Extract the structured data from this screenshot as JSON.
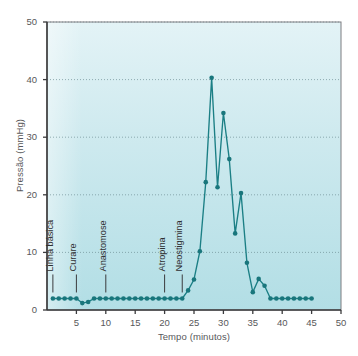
{
  "chart_data": {
    "type": "line",
    "title": "",
    "xlabel": "Tempo (minutos)",
    "ylabel": "Pressão (mmHg)",
    "xlim": [
      0,
      50
    ],
    "ylim": [
      0,
      50
    ],
    "xticks": [
      5,
      10,
      15,
      20,
      25,
      30,
      35,
      40,
      45,
      50
    ],
    "yticks": [
      0,
      10,
      20,
      30,
      40,
      50
    ],
    "grid": "horizontal-dotted",
    "legend": "none",
    "series": [
      {
        "name": "Pressão",
        "color": "#1b7f85",
        "marker": "circle",
        "x": [
          1,
          2,
          3,
          4,
          5,
          6,
          7,
          8,
          9,
          10,
          11,
          12,
          13,
          14,
          15,
          16,
          17,
          18,
          19,
          20,
          21,
          22,
          23,
          24,
          25,
          26,
          27,
          28,
          29,
          30,
          31,
          32,
          33,
          34,
          35,
          36,
          37,
          38,
          39,
          40,
          41,
          42,
          43,
          44,
          45
        ],
        "y": [
          2.0,
          2.0,
          2.0,
          2.0,
          2.0,
          1.2,
          1.4,
          2.0,
          2.0,
          2.0,
          2.0,
          2.0,
          2.0,
          2.0,
          2.0,
          2.0,
          2.0,
          2.0,
          2.0,
          2.0,
          2.0,
          2.0,
          2.0,
          3.4,
          5.3,
          10.2,
          22.2,
          40.3,
          21.3,
          34.2,
          26.2,
          13.3,
          20.3,
          8.2,
          3.1,
          5.4,
          4.2,
          2.0,
          2.0,
          2.0,
          2.0,
          2.0,
          2.0,
          2.0,
          2.0
        ]
      }
    ],
    "annotations": [
      {
        "label": "Linha básica",
        "x": 1,
        "y": 2.0
      },
      {
        "label": "Curare",
        "x": 5,
        "y": 2.0
      },
      {
        "label": "Anastomose",
        "x": 10,
        "y": 2.0
      },
      {
        "label": "Atropina",
        "x": 20,
        "y": 2.0
      },
      {
        "label": "Neostigmina",
        "x": 23,
        "y": 2.0
      }
    ],
    "colors": {
      "line": "#1b7f85",
      "marker": "#19767c",
      "plot_background_top": "#e0f2f5",
      "plot_background_bottom": "#b5e0e6",
      "gridline": "#6f8f96",
      "axis": "#3b3b3d",
      "text": "#58585a"
    }
  },
  "caption": {
    "text": ""
  }
}
